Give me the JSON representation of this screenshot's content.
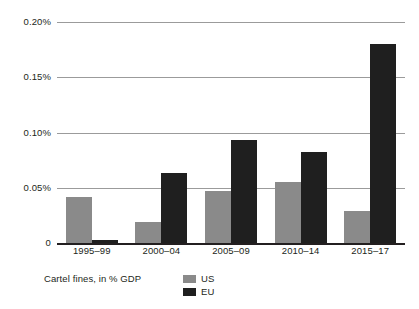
{
  "chart_data": {
    "type": "bar",
    "title": "",
    "subtitle": "",
    "xlabel": "",
    "ylabel": "",
    "categories": [
      "1995–99",
      "2000–04",
      "2005–09",
      "2010–14",
      "2015–17"
    ],
    "series": [
      {
        "name": "US",
        "color": "#8a8a8a",
        "values": [
          0.042,
          0.019,
          0.047,
          0.055,
          0.029
        ]
      },
      {
        "name": "EU",
        "color": "#1f1f1f",
        "values": [
          0.003,
          0.063,
          0.093,
          0.082,
          0.18
        ]
      }
    ],
    "ylim": [
      0,
      0.2
    ],
    "ytick_values": [
      0.2,
      0.15,
      0.1,
      0.05,
      0
    ],
    "ytick_labels": [
      "0.20%",
      "0.15%",
      "0.10%",
      "0.05%",
      "0"
    ],
    "grid": true,
    "legend_position": "bottom-left",
    "legend_title": "Cartel fines, in % GDP"
  }
}
